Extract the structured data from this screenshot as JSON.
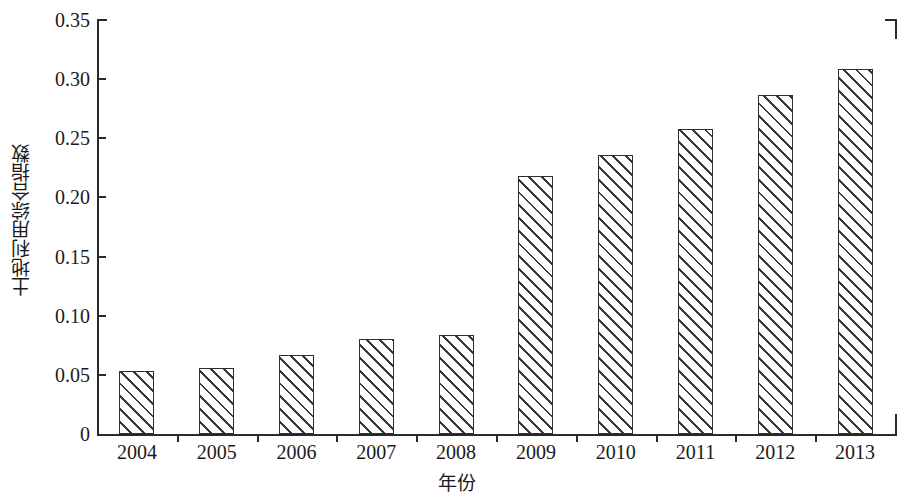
{
  "chart_data": {
    "type": "bar",
    "title": "",
    "xlabel": "年份",
    "ylabel": "土地利用综合指数",
    "categories": [
      "2004",
      "2005",
      "2006",
      "2007",
      "2008",
      "2009",
      "2010",
      "2011",
      "2012",
      "2013"
    ],
    "values": [
      0.053,
      0.056,
      0.067,
      0.08,
      0.084,
      0.218,
      0.236,
      0.258,
      0.287,
      0.309
    ],
    "ylim": [
      0,
      0.35
    ],
    "ytick_values": [
      0,
      0.05,
      0.1,
      0.15,
      0.2,
      0.25,
      0.3,
      0.35
    ],
    "ytick_labels": [
      "0",
      "0.05",
      "0.10",
      "0.15",
      "0.20",
      "0.25",
      "0.30",
      "0.35"
    ],
    "grid": false,
    "legend": null,
    "legend_position": "none",
    "series": [
      {
        "name": "土地利用综合指数",
        "values": [
          0.053,
          0.056,
          0.067,
          0.08,
          0.084,
          0.218,
          0.236,
          0.258,
          0.287,
          0.309
        ]
      }
    ],
    "bar_style": {
      "fill": "#ffffff",
      "hatch": "diagonal-forward-slash",
      "edge_color": "#2e2e2e"
    },
    "axis_color": "#2a2a2a",
    "background": "#ffffff"
  }
}
